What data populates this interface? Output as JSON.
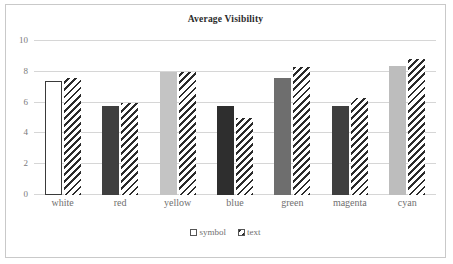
{
  "chart_data": {
    "type": "bar",
    "title": "Average Visibility",
    "xlabel": "",
    "ylabel": "",
    "ylim": [
      0,
      10
    ],
    "yticks": [
      0,
      2,
      4,
      6,
      8,
      10
    ],
    "grid": true,
    "legend_position": "bottom",
    "categories": [
      "white",
      "red",
      "yellow",
      "blue",
      "green",
      "magenta",
      "cyan"
    ],
    "series": [
      {
        "name": "symbol",
        "style": "solid",
        "values": [
          7.4,
          5.8,
          8.0,
          5.8,
          7.6,
          5.8,
          8.4
        ],
        "colors": [
          "#ffffff",
          "#3f3f3f",
          "#c4c4c4",
          "#2e2e2e",
          "#6e6e6e",
          "#3f3f3f",
          "#bdbdbd"
        ]
      },
      {
        "name": "text",
        "style": "diagonal-hatch",
        "values": [
          7.6,
          6.0,
          8.0,
          5.0,
          8.3,
          6.3,
          8.8
        ],
        "colors": [
          "#2b2b2b",
          "#2b2b2b",
          "#2b2b2b",
          "#2b2b2b",
          "#2b2b2b",
          "#2b2b2b",
          "#2b2b2b"
        ]
      }
    ]
  },
  "legend": {
    "items": [
      {
        "label": "symbol",
        "swatch": "open-square-icon"
      },
      {
        "label": "text",
        "swatch": "hatched-square-icon"
      }
    ]
  },
  "colors": {
    "frame_border": "#c9c9c9",
    "gridline": "#d6d6d6",
    "tick_text": "#7a7a7a",
    "label_text": "#6f6f6f",
    "title_text": "#2b2b2b"
  }
}
